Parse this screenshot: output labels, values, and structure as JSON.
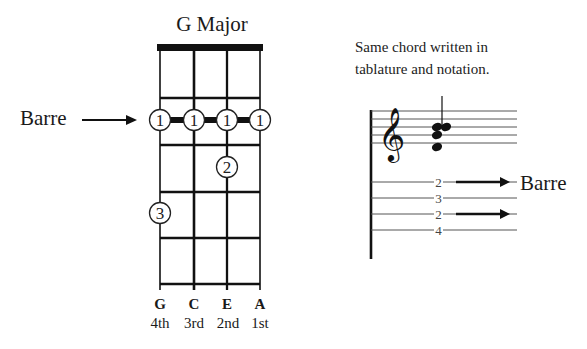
{
  "chord": {
    "title": "G Major",
    "barre_label": "Barre",
    "strings": [
      {
        "name": "G",
        "number": "4th"
      },
      {
        "name": "C",
        "number": "3rd"
      },
      {
        "name": "E",
        "number": "2nd"
      },
      {
        "name": "A",
        "number": "1st"
      }
    ],
    "frets_shown": 5,
    "fingers": [
      {
        "string": "G",
        "fret": 2,
        "finger": "1"
      },
      {
        "string": "C",
        "fret": 2,
        "finger": "1"
      },
      {
        "string": "E",
        "fret": 2,
        "finger": "1"
      },
      {
        "string": "A",
        "fret": 2,
        "finger": "1"
      },
      {
        "string": "E",
        "fret": 3,
        "finger": "2"
      },
      {
        "string": "G",
        "fret": 4,
        "finger": "3"
      }
    ]
  },
  "notation": {
    "caption_line1": "Same chord written in",
    "caption_line2": "tablature and notation.",
    "clef": "treble-clef",
    "tab_numbers": [
      "2",
      "3",
      "2",
      "4"
    ],
    "barre_label": "Barre"
  },
  "colors": {
    "ink": "#1a1a1a",
    "staff_line": "#555555",
    "background": "#ffffff"
  }
}
